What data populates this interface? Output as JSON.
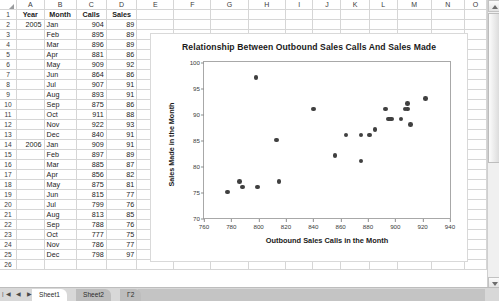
{
  "spreadsheet": {
    "column_headers": [
      "A",
      "B",
      "C",
      "D",
      "E",
      "F",
      "G",
      "H",
      "I",
      "J",
      "K",
      "L",
      "M",
      "N",
      "O"
    ],
    "table_headers": [
      "Year",
      "Month",
      "Calls",
      "Sales"
    ],
    "rows": [
      {
        "row": "2",
        "year": "2005",
        "month": "Jan",
        "calls": "904",
        "sales": "89"
      },
      {
        "row": "3",
        "year": "",
        "month": "Feb",
        "calls": "895",
        "sales": "89"
      },
      {
        "row": "4",
        "year": "",
        "month": "Mar",
        "calls": "896",
        "sales": "89"
      },
      {
        "row": "5",
        "year": "",
        "month": "Apr",
        "calls": "881",
        "sales": "86"
      },
      {
        "row": "6",
        "year": "",
        "month": "May",
        "calls": "909",
        "sales": "92"
      },
      {
        "row": "7",
        "year": "",
        "month": "Jun",
        "calls": "864",
        "sales": "86"
      },
      {
        "row": "8",
        "year": "",
        "month": "Jul",
        "calls": "907",
        "sales": "91"
      },
      {
        "row": "9",
        "year": "",
        "month": "Aug",
        "calls": "893",
        "sales": "91"
      },
      {
        "row": "10",
        "year": "",
        "month": "Sep",
        "calls": "875",
        "sales": "86"
      },
      {
        "row": "11",
        "year": "",
        "month": "Oct",
        "calls": "911",
        "sales": "88"
      },
      {
        "row": "12",
        "year": "",
        "month": "Nov",
        "calls": "922",
        "sales": "93"
      },
      {
        "row": "13",
        "year": "",
        "month": "Dec",
        "calls": "840",
        "sales": "91"
      },
      {
        "row": "14",
        "year": "2006",
        "month": "Jan",
        "calls": "909",
        "sales": "91"
      },
      {
        "row": "15",
        "year": "",
        "month": "Feb",
        "calls": "897",
        "sales": "89"
      },
      {
        "row": "16",
        "year": "",
        "month": "Mar",
        "calls": "885",
        "sales": "87"
      },
      {
        "row": "17",
        "year": "",
        "month": "Apr",
        "calls": "856",
        "sales": "82"
      },
      {
        "row": "18",
        "year": "",
        "month": "May",
        "calls": "875",
        "sales": "81"
      },
      {
        "row": "19",
        "year": "",
        "month": "Jun",
        "calls": "815",
        "sales": "77"
      },
      {
        "row": "20",
        "year": "",
        "month": "Jul",
        "calls": "799",
        "sales": "76"
      },
      {
        "row": "21",
        "year": "",
        "month": "Aug",
        "calls": "813",
        "sales": "85"
      },
      {
        "row": "22",
        "year": "",
        "month": "Sep",
        "calls": "788",
        "sales": "76"
      },
      {
        "row": "23",
        "year": "",
        "month": "Oct",
        "calls": "777",
        "sales": "75"
      },
      {
        "row": "24",
        "year": "",
        "month": "Nov",
        "calls": "786",
        "sales": "77"
      },
      {
        "row": "25",
        "year": "",
        "month": "Dec",
        "calls": "798",
        "sales": "97"
      },
      {
        "row": "26",
        "year": "",
        "month": "",
        "calls": "",
        "sales": ""
      }
    ]
  },
  "chart_data": {
    "type": "scatter",
    "title": "Relationship Between Outbound Sales Calls And Sales Made",
    "xlabel": "Outbound Sales Calls in the Month",
    "ylabel": "Sales Made in the Month",
    "xlim": [
      760,
      940
    ],
    "ylim": [
      70,
      100
    ],
    "xticks": [
      760,
      780,
      800,
      820,
      840,
      860,
      880,
      900,
      920,
      940
    ],
    "yticks": [
      70,
      75,
      80,
      85,
      90,
      95,
      100
    ],
    "grid": false,
    "legend": "none",
    "marker_color": "#404040",
    "points": [
      {
        "x": 904,
        "y": 89
      },
      {
        "x": 895,
        "y": 89
      },
      {
        "x": 896,
        "y": 89
      },
      {
        "x": 881,
        "y": 86
      },
      {
        "x": 909,
        "y": 92
      },
      {
        "x": 864,
        "y": 86
      },
      {
        "x": 907,
        "y": 91
      },
      {
        "x": 893,
        "y": 91
      },
      {
        "x": 875,
        "y": 86
      },
      {
        "x": 911,
        "y": 88
      },
      {
        "x": 922,
        "y": 93
      },
      {
        "x": 840,
        "y": 91
      },
      {
        "x": 909,
        "y": 91
      },
      {
        "x": 897,
        "y": 89
      },
      {
        "x": 885,
        "y": 87
      },
      {
        "x": 856,
        "y": 82
      },
      {
        "x": 875,
        "y": 81
      },
      {
        "x": 815,
        "y": 77
      },
      {
        "x": 799,
        "y": 76
      },
      {
        "x": 813,
        "y": 85
      },
      {
        "x": 788,
        "y": 76
      },
      {
        "x": 777,
        "y": 75
      },
      {
        "x": 786,
        "y": 77
      },
      {
        "x": 798,
        "y": 97
      }
    ]
  },
  "tabs": {
    "nav_glyphs": "|◀ ◀ ▶ ▶|",
    "items": [
      "Sheet1",
      "Sheet2",
      "Γ2"
    ]
  }
}
